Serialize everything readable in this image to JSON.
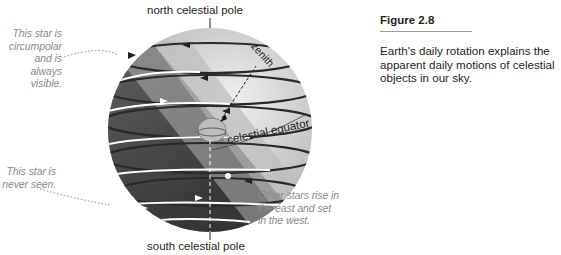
{
  "figure": {
    "title": "Figure 2.8",
    "caption": "Earth's daily rotation explains the apparent daily motions of celestial objects in our sky."
  },
  "diagram": {
    "labels": {
      "north_pole": "north celestial pole",
      "south_pole": "south celestial pole",
      "zenith": "zenith",
      "equator": "celestial equator"
    },
    "annotations": {
      "circumpolar": [
        "This star is",
        "circumpolar",
        "and is always",
        "visible."
      ],
      "never_seen": [
        "This star is",
        "never seen."
      ],
      "rise_set": [
        "Other stars rise in",
        "the east and set",
        "in the west."
      ]
    },
    "colors": {
      "sky_light": "#d9d9d9",
      "sky_dark": "#3a3a3a",
      "horizon_plane": "#bdbdbd",
      "annotation_text": "#8a8a8a"
    }
  }
}
